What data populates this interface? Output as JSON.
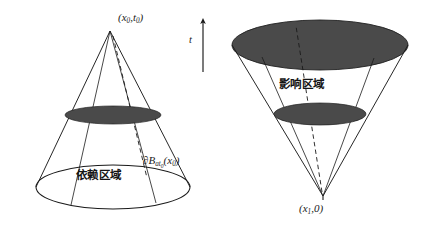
{
  "figure": {
    "background_color": "#ffffff",
    "stroke_color": "#1a1a1a",
    "shade_color": "#4a4a4a",
    "width": 430,
    "height": 231
  },
  "axis": {
    "name": "t-axis",
    "label": "t",
    "direction": "up",
    "x": 203,
    "y_top": 18,
    "y_bottom": 72
  },
  "left_cone": {
    "name": "domain-of-dependence-cone",
    "orientation": "apex-up",
    "apex_label_text": "(x0, t0)",
    "apex_label_html": "(<i>x</i><sub>0</sub>,<i>t</i><sub>0</sub>)",
    "region_label": "依赖区域",
    "region_label_meaning": "domain of dependence",
    "boundary_label_text": "∂Bat0(x0)",
    "boundary_label_html": "∂<i>B</i><sub><i>at</i><sub>0</sub></sub>(<i>x</i><sub>0</sub>)",
    "apex": {
      "x": 110,
      "y": 31
    },
    "base_ellipse": {
      "cx": 113,
      "cy": 187,
      "rx": 77,
      "ry": 22,
      "filled": false
    },
    "shaded_ellipse": {
      "cx": 113,
      "cy": 115,
      "rx": 48,
      "ry": 9,
      "filled": true
    }
  },
  "right_cone": {
    "name": "domain-of-influence-cone",
    "orientation": "apex-down",
    "apex_label_text": "(x1, 0)",
    "apex_label_html": "(<i>x</i><sub>1</sub>,0)",
    "region_label": "影响区域",
    "region_label_meaning": "domain of influence",
    "apex": {
      "x": 323,
      "y": 196
    },
    "top_ellipse": {
      "cx": 320,
      "cy": 45,
      "rx": 88,
      "ry": 25,
      "filled": true
    },
    "shaded_ellipse": {
      "cx": 320,
      "cy": 114,
      "rx": 46,
      "ry": 11,
      "filled": true
    }
  }
}
